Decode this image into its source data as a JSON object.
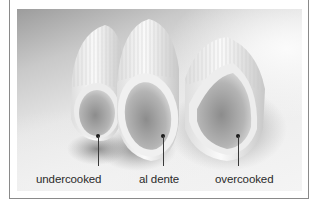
{
  "image": {
    "subject": "three penne pasta pieces on a plate",
    "labels": [
      {
        "text": "undercooked"
      },
      {
        "text": "al dente"
      },
      {
        "text": "overcooked"
      }
    ]
  },
  "colors": {
    "frame_border": "#8a8a8a",
    "label_text": "#2b2b2b",
    "callout": "#1a1a1a"
  }
}
